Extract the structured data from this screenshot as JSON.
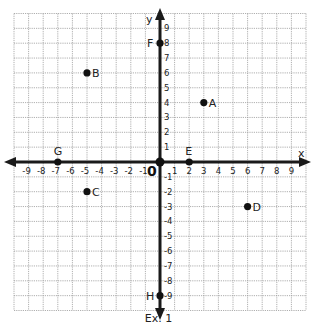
{
  "chart_data": {
    "type": "scatter",
    "title": "",
    "caption": "Ex. 1",
    "xlabel": "x",
    "ylabel": "y",
    "xlim": [
      -10,
      10
    ],
    "ylim": [
      -10,
      10
    ],
    "grid": true,
    "origin_label": "0",
    "x_ticks": [
      -9,
      -8,
      -7,
      -6,
      -5,
      -4,
      -3,
      -2,
      -1,
      1,
      2,
      3,
      4,
      5,
      6,
      7,
      8,
      9
    ],
    "y_ticks": [
      -9,
      -8,
      -7,
      -6,
      -5,
      -4,
      -3,
      -2,
      -1,
      1,
      2,
      3,
      4,
      5,
      6,
      7,
      8,
      9
    ],
    "points": [
      {
        "label": "A",
        "x": 3,
        "y": 4
      },
      {
        "label": "B",
        "x": -5,
        "y": 6
      },
      {
        "label": "C",
        "x": -5,
        "y": -2
      },
      {
        "label": "D",
        "x": 6,
        "y": -3
      },
      {
        "label": "E",
        "x": 2,
        "y": 0
      },
      {
        "label": "F",
        "x": 0,
        "y": 8
      },
      {
        "label": "G",
        "x": -7,
        "y": 0
      },
      {
        "label": "H",
        "x": 0,
        "y": -9
      }
    ],
    "origin_point": {
      "x": 0,
      "y": 0
    }
  },
  "colors": {
    "grid": "#9a9a9a",
    "axis": "#1a1a1a",
    "point": "#111111"
  }
}
